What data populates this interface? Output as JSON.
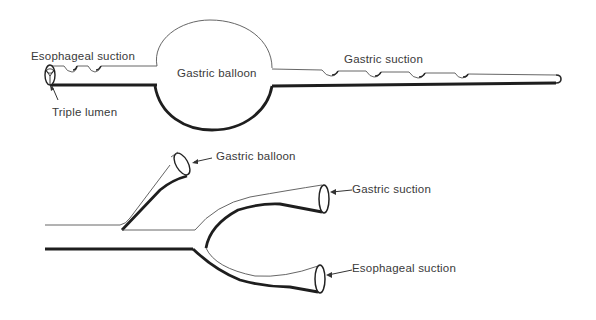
{
  "figure": {
    "top_view": {
      "labels": {
        "esophageal_suction": "Esophageal suction",
        "gastric_balloon": "Gastric balloon",
        "gastric_suction": "Gastric suction",
        "triple_lumen": "Triple lumen"
      }
    },
    "bottom_view": {
      "labels": {
        "gastric_balloon": "Gastric balloon",
        "gastric_suction": "Gastric suction",
        "esophageal_suction": "Esophageal suction"
      }
    }
  },
  "colors": {
    "background": "#ffffff",
    "line": "#1e1e1e",
    "text": "#3a3a3a"
  }
}
